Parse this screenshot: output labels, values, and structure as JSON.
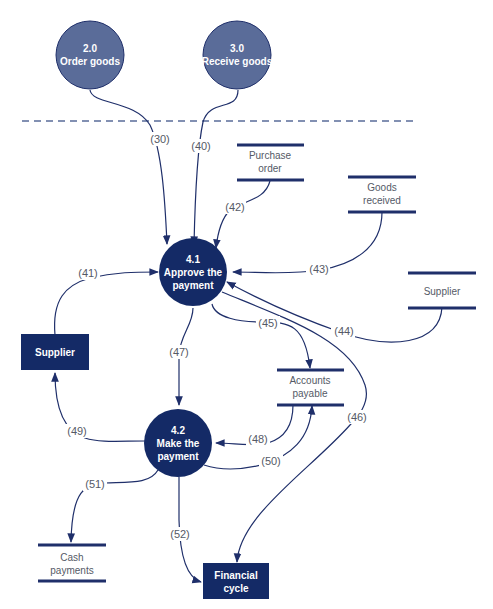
{
  "colors": {
    "process_dark": "#142a66",
    "process_light": "#5a6c99",
    "line": "#1f2f6a",
    "label": "#555a66"
  },
  "processes": [
    {
      "id": "2.0",
      "name": "Order goods",
      "style": "external-light"
    },
    {
      "id": "3.0",
      "name": "Receive goods",
      "style": "external-light"
    },
    {
      "id": "4.1",
      "line1": "Approve the",
      "line2": "payment"
    },
    {
      "id": "4.2",
      "line1": "Make the",
      "line2": "payment"
    }
  ],
  "entities": [
    {
      "name": "Supplier"
    },
    {
      "line1": "Financial",
      "line2": "cycle"
    }
  ],
  "data_stores": [
    {
      "line1": "Purchase",
      "line2": "order"
    },
    {
      "line1": "Goods",
      "line2": "received"
    },
    {
      "line1": "Supplier",
      "line2": ""
    },
    {
      "line1": "Accounts",
      "line2": "payable"
    },
    {
      "line1": "Cash",
      "line2": "payments"
    }
  ],
  "flows": [
    "(30)",
    "(40)",
    "(41)",
    "(42)",
    "(43)",
    "(44)",
    "(45)",
    "(46)",
    "(47)",
    "(48)",
    "(49)",
    "(50)",
    "(51)",
    "(52)"
  ]
}
